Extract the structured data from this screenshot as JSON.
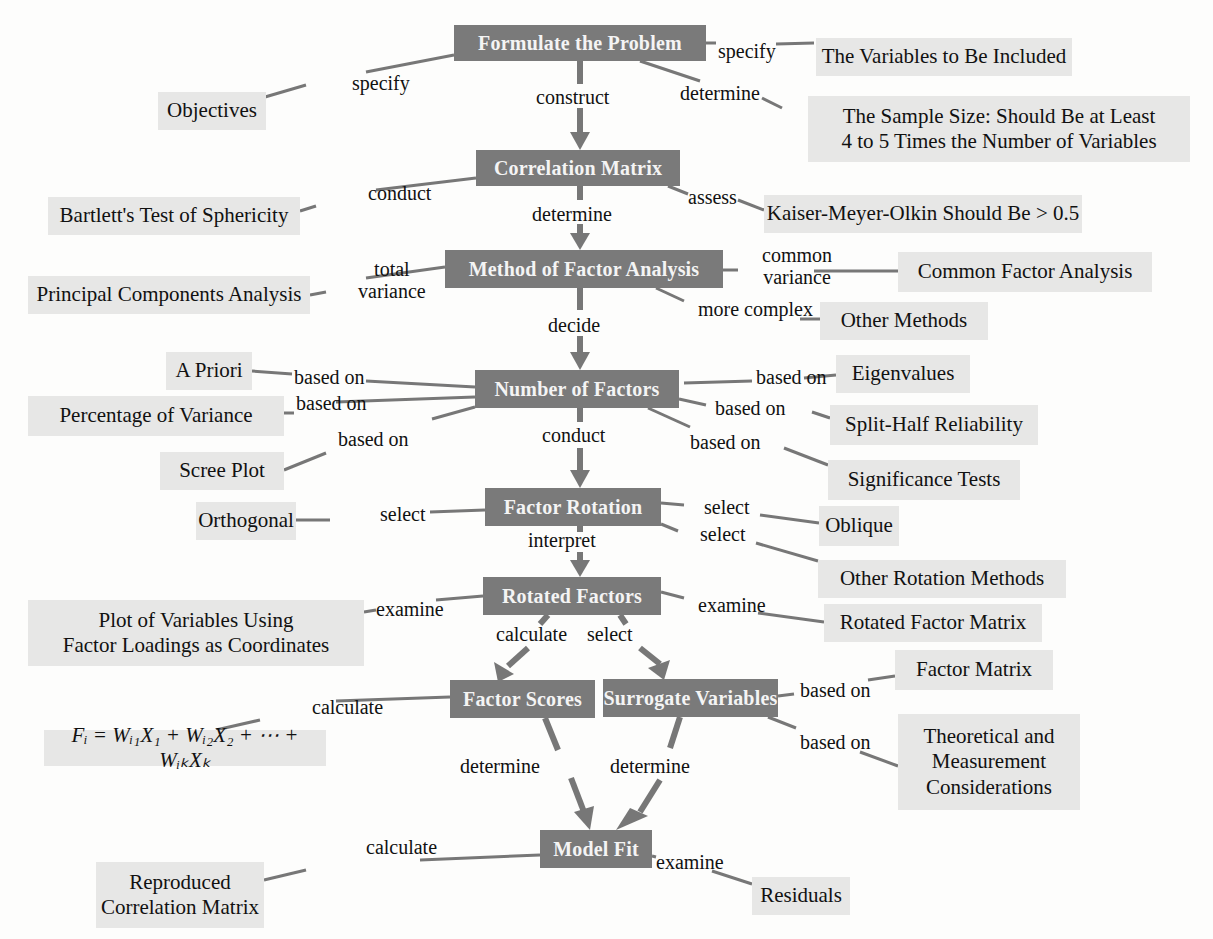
{
  "diagram": {
    "colors": {
      "main_box": "#7a7a7a",
      "main_text": "#f4f4f4",
      "leaf_box": "#e7e7e6",
      "connector": "#777777"
    },
    "main_nodes": [
      {
        "id": "formulate",
        "label": "Formulate the Problem",
        "x": 454,
        "y": 25,
        "w": 252,
        "h": 36
      },
      {
        "id": "corr",
        "label": "Correlation Matrix",
        "x": 476,
        "y": 150,
        "w": 204,
        "h": 36
      },
      {
        "id": "method",
        "label": "Method of Factor Analysis",
        "x": 445,
        "y": 250,
        "w": 278,
        "h": 38
      },
      {
        "id": "numfac",
        "label": "Number of Factors",
        "x": 475,
        "y": 370,
        "w": 204,
        "h": 38
      },
      {
        "id": "rotation",
        "label": "Factor Rotation",
        "x": 485,
        "y": 488,
        "w": 176,
        "h": 38
      },
      {
        "id": "rotated",
        "label": "Rotated Factors",
        "x": 483,
        "y": 577,
        "w": 178,
        "h": 38
      },
      {
        "id": "scores",
        "label": "Factor Scores",
        "x": 450,
        "y": 680,
        "w": 145,
        "h": 38
      },
      {
        "id": "surrogate",
        "label": "Surrogate Variables",
        "x": 603,
        "y": 679,
        "w": 175,
        "h": 38
      },
      {
        "id": "modelfit",
        "label": "Model Fit",
        "x": 540,
        "y": 830,
        "w": 112,
        "h": 38
      }
    ],
    "leaf_nodes": [
      {
        "id": "objectives",
        "label": "Objectives",
        "x": 158,
        "y": 92,
        "w": 108,
        "h": 38
      },
      {
        "id": "variables",
        "label": "The Variables to Be Included",
        "x": 816,
        "y": 38,
        "w": 256,
        "h": 38
      },
      {
        "id": "samplesize",
        "label": "The Sample Size: Should Be at Least\n4 to 5 Times the Number of Variables",
        "x": 808,
        "y": 96,
        "w": 382,
        "h": 66
      },
      {
        "id": "bartlett",
        "label": "Bartlett's Test of Sphericity",
        "x": 48,
        "y": 197,
        "w": 252,
        "h": 38
      },
      {
        "id": "kmo",
        "label": "Kaiser-Meyer-Olkin Should Be > 0.5",
        "x": 764,
        "y": 195,
        "w": 318,
        "h": 38
      },
      {
        "id": "pca",
        "label": "Principal Components Analysis",
        "x": 28,
        "y": 276,
        "w": 282,
        "h": 38
      },
      {
        "id": "cfa",
        "label": "Common Factor Analysis",
        "x": 898,
        "y": 252,
        "w": 254,
        "h": 40
      },
      {
        "id": "othermethods",
        "label": "Other Methods",
        "x": 820,
        "y": 302,
        "w": 168,
        "h": 38
      },
      {
        "id": "apriori",
        "label": "A Priori",
        "x": 166,
        "y": 352,
        "w": 86,
        "h": 38
      },
      {
        "id": "eigen",
        "label": "Eigenvalues",
        "x": 836,
        "y": 355,
        "w": 134,
        "h": 38
      },
      {
        "id": "pctvar",
        "label": "Percentage of Variance",
        "x": 28,
        "y": 396,
        "w": 256,
        "h": 40
      },
      {
        "id": "splithalf",
        "label": "Split-Half Reliability",
        "x": 830,
        "y": 405,
        "w": 208,
        "h": 40
      },
      {
        "id": "scree",
        "label": "Scree Plot",
        "x": 160,
        "y": 452,
        "w": 124,
        "h": 38
      },
      {
        "id": "sigtests",
        "label": "Significance Tests",
        "x": 828,
        "y": 460,
        "w": 192,
        "h": 40
      },
      {
        "id": "orthogonal",
        "label": "Orthogonal",
        "x": 196,
        "y": 502,
        "w": 100,
        "h": 38
      },
      {
        "id": "oblique",
        "label": "Oblique",
        "x": 819,
        "y": 506,
        "w": 80,
        "h": 40
      },
      {
        "id": "otherrot",
        "label": "Other Rotation Methods",
        "x": 818,
        "y": 560,
        "w": 248,
        "h": 38
      },
      {
        "id": "plotvars",
        "label": "Plot of Variables Using\nFactor Loadings as Coordinates",
        "x": 28,
        "y": 600,
        "w": 336,
        "h": 66
      },
      {
        "id": "rotatedmatrix",
        "label": "Rotated Factor Matrix",
        "x": 824,
        "y": 604,
        "w": 218,
        "h": 38
      },
      {
        "id": "factormatrix",
        "label": "Factor Matrix",
        "x": 895,
        "y": 650,
        "w": 158,
        "h": 40
      },
      {
        "id": "formula",
        "label": "Fᵢ = Wᵢ₁X₁ + Wᵢ₂X₂ + ⋯ + WᵢₖXₖ",
        "x": 44,
        "y": 730,
        "w": 282,
        "h": 36
      },
      {
        "id": "theoretical",
        "label": "Theoretical and\nMeasurement\nConsiderations",
        "x": 898,
        "y": 714,
        "w": 182,
        "h": 96
      },
      {
        "id": "reproduced",
        "label": "Reproduced\nCorrelation Matrix",
        "x": 96,
        "y": 862,
        "w": 168,
        "h": 66
      },
      {
        "id": "residuals",
        "label": "Residuals",
        "x": 752,
        "y": 877,
        "w": 98,
        "h": 38
      }
    ],
    "edge_labels": [
      {
        "id": "l1",
        "text": "specify",
        "x": 352,
        "y": 72
      },
      {
        "id": "l2",
        "text": "specify",
        "x": 718,
        "y": 40
      },
      {
        "id": "l3",
        "text": "construct",
        "x": 536,
        "y": 86
      },
      {
        "id": "l4",
        "text": "determine",
        "x": 680,
        "y": 82
      },
      {
        "id": "l5",
        "text": "conduct",
        "x": 368,
        "y": 182
      },
      {
        "id": "l6",
        "text": "determine",
        "x": 532,
        "y": 203
      },
      {
        "id": "l7",
        "text": "assess",
        "x": 688,
        "y": 186
      },
      {
        "id": "l8",
        "text": "total\nvariance",
        "x": 358,
        "y": 258
      },
      {
        "id": "l9",
        "text": "common\nvariance",
        "x": 762,
        "y": 244
      },
      {
        "id": "l10",
        "text": "more complex",
        "x": 698,
        "y": 298
      },
      {
        "id": "l11",
        "text": "decide",
        "x": 548,
        "y": 314
      },
      {
        "id": "l12",
        "text": "based on",
        "x": 294,
        "y": 370
      },
      {
        "id": "l13",
        "text": "based on",
        "x": 756,
        "y": 370
      },
      {
        "id": "l14",
        "text": "based on",
        "x": 304,
        "y": 392
      },
      {
        "id": "l15",
        "text": "based on",
        "x": 719,
        "y": 399
      },
      {
        "id": "l16",
        "text": "based on",
        "x": 340,
        "y": 428
      },
      {
        "id": "l17",
        "text": "conduct",
        "x": 542,
        "y": 426
      },
      {
        "id": "l18",
        "text": "based on",
        "x": 690,
        "y": 431
      },
      {
        "id": "l19",
        "text": "select",
        "x": 382,
        "y": 503
      },
      {
        "id": "l20",
        "text": "select",
        "x": 706,
        "y": 498
      },
      {
        "id": "l21",
        "text": "select",
        "x": 702,
        "y": 525
      },
      {
        "id": "l22",
        "text": "interpret",
        "x": 528,
        "y": 531
      },
      {
        "id": "l23",
        "text": "examine",
        "x": 388,
        "y": 600
      },
      {
        "id": "l24",
        "text": "examine",
        "x": 700,
        "y": 596
      },
      {
        "id": "l25",
        "text": "calculate",
        "x": 496,
        "y": 625
      },
      {
        "id": "l26",
        "text": "select",
        "x": 587,
        "y": 625
      },
      {
        "id": "l27",
        "text": "calculate",
        "x": 312,
        "y": 698
      },
      {
        "id": "l28",
        "text": "based on",
        "x": 800,
        "y": 681
      },
      {
        "id": "l29",
        "text": "based on",
        "x": 800,
        "y": 733
      },
      {
        "id": "l30",
        "text": "determine",
        "x": 464,
        "y": 757
      },
      {
        "id": "l31",
        "text": "determine",
        "x": 610,
        "y": 757
      },
      {
        "id": "l32",
        "text": "calculate",
        "x": 366,
        "y": 838
      },
      {
        "id": "l33",
        "text": "examine",
        "x": 656,
        "y": 853
      }
    ]
  }
}
